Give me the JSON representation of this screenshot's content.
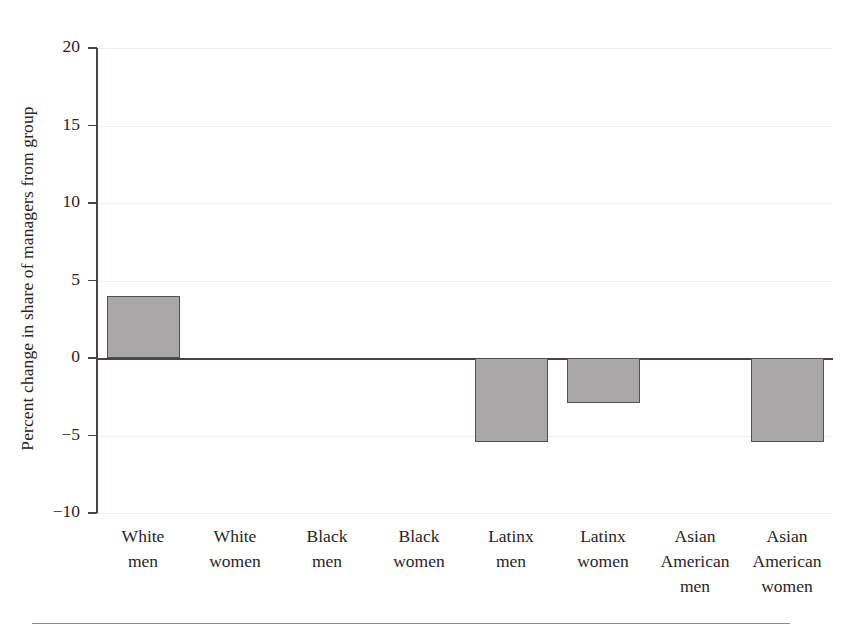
{
  "figure": {
    "ylabel": "Percent change in share of managers from group",
    "bottom_rule": true
  },
  "chart_data": {
    "type": "bar",
    "title": "",
    "xlabel": "",
    "ylabel": "Percent change in share of managers from group",
    "categories": [
      "White men",
      "White women",
      "Black men",
      "Black women",
      "Latinx men",
      "Latinx women",
      "Asian American men",
      "Asian American women"
    ],
    "category_lines": [
      [
        "White",
        "men"
      ],
      [
        "White",
        "women"
      ],
      [
        "Black",
        "men"
      ],
      [
        "Black",
        "women"
      ],
      [
        "Latinx",
        "men"
      ],
      [
        "Latinx",
        "women"
      ],
      [
        "Asian",
        "American",
        "men"
      ],
      [
        "Asian",
        "American",
        "women"
      ]
    ],
    "values": [
      4.0,
      0,
      0,
      0,
      -5.4,
      -2.9,
      0,
      -5.4
    ],
    "ylim": [
      -10,
      20
    ],
    "yticks": [
      20,
      15,
      10,
      5,
      0,
      -5,
      -10
    ],
    "ytick_labels": [
      "20",
      "15",
      "10",
      "5",
      "0",
      "−5",
      "−10"
    ],
    "grid": true,
    "legend": "none",
    "bar_color": "#a9a7a8",
    "bar_edge_color": "#55504f",
    "axis_color": "#4a4446"
  }
}
